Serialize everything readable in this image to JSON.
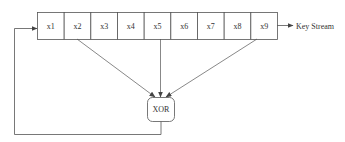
{
  "diagram": {
    "register": {
      "cells": [
        "x1",
        "x2",
        "x3",
        "x4",
        "x5",
        "x6",
        "x7",
        "x8",
        "x9"
      ]
    },
    "output_label": "Key Stream",
    "xor_label": "XOR",
    "taps": [
      "x2",
      "x5",
      "x9"
    ],
    "feedback_target": "x1",
    "colors": {
      "stroke": "#555555",
      "text": "#333333",
      "background": "#ffffff"
    }
  }
}
